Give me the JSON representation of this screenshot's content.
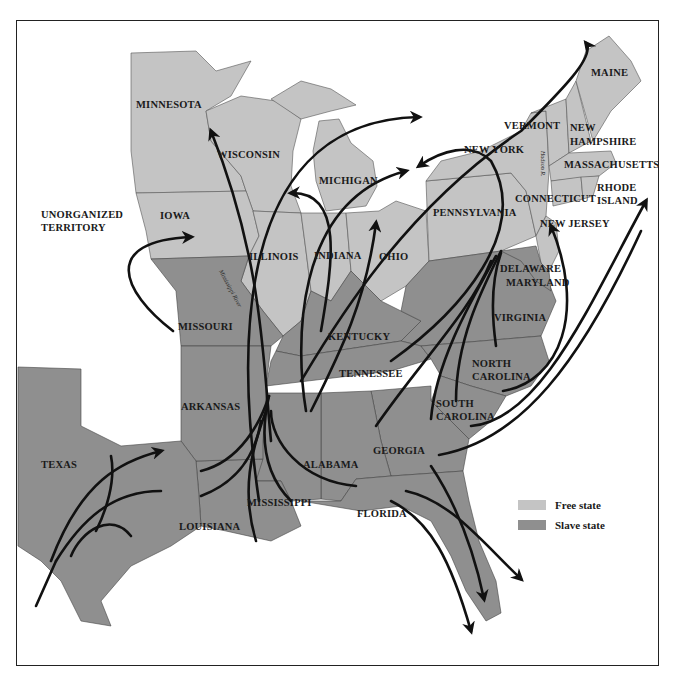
{
  "map": {
    "title": "",
    "colors": {
      "free_state": "#c4c4c4",
      "slave_state": "#8f8f8f",
      "water": "#ffffff",
      "routes": "#111111"
    },
    "labels": {
      "minnesota": "MINNESOTA",
      "wisconsin": "WISCONSIN",
      "michigan": "MICHIGAN",
      "iowa": "IOWA",
      "illinois": "ILLINOIS",
      "indiana": "INDIANA",
      "ohio": "OHIO",
      "pennsylvania": "PENNSYLVANIA",
      "new_york": "NEW YORK",
      "vermont": "VERMONT",
      "maine": "MAINE",
      "new_hampshire_1": "NEW",
      "new_hampshire_2": "HAMPSHIRE",
      "massachusetts": "MASSACHUSETTS",
      "rhode_island_1": "RHODE",
      "rhode_island_2": "ISLAND",
      "connecticut": "CONNECTICUT",
      "new_jersey": "NEW JERSEY",
      "delaware": "DELAWARE",
      "maryland": "MARYLAND",
      "virginia": "VIRGINIA",
      "north_carolina_1": "NORTH",
      "north_carolina_2": "CAROLINA",
      "south_carolina_1": "SOUTH",
      "south_carolina_2": "CAROLINA",
      "georgia": "GEORGIA",
      "florida": "FLORIDA",
      "alabama": "ALABAMA",
      "mississippi": "MISSISSIPPI",
      "louisiana": "LOUISIANA",
      "tennessee": "TENNESSEE",
      "kentucky": "KENTUCKY",
      "arkansas": "ARKANSAS",
      "missouri": "MISSOURI",
      "texas": "TEXAS",
      "unorganized_1": "UNORGANIZED",
      "unorganized_2": "TERRITORY",
      "mississippi_river": "Mississippi River",
      "hudson_river": "Hudson R."
    },
    "legend": [
      {
        "label": "Free state",
        "color": "#c4c4c4"
      },
      {
        "label": "Slave state",
        "color": "#8f8f8f"
      }
    ]
  }
}
